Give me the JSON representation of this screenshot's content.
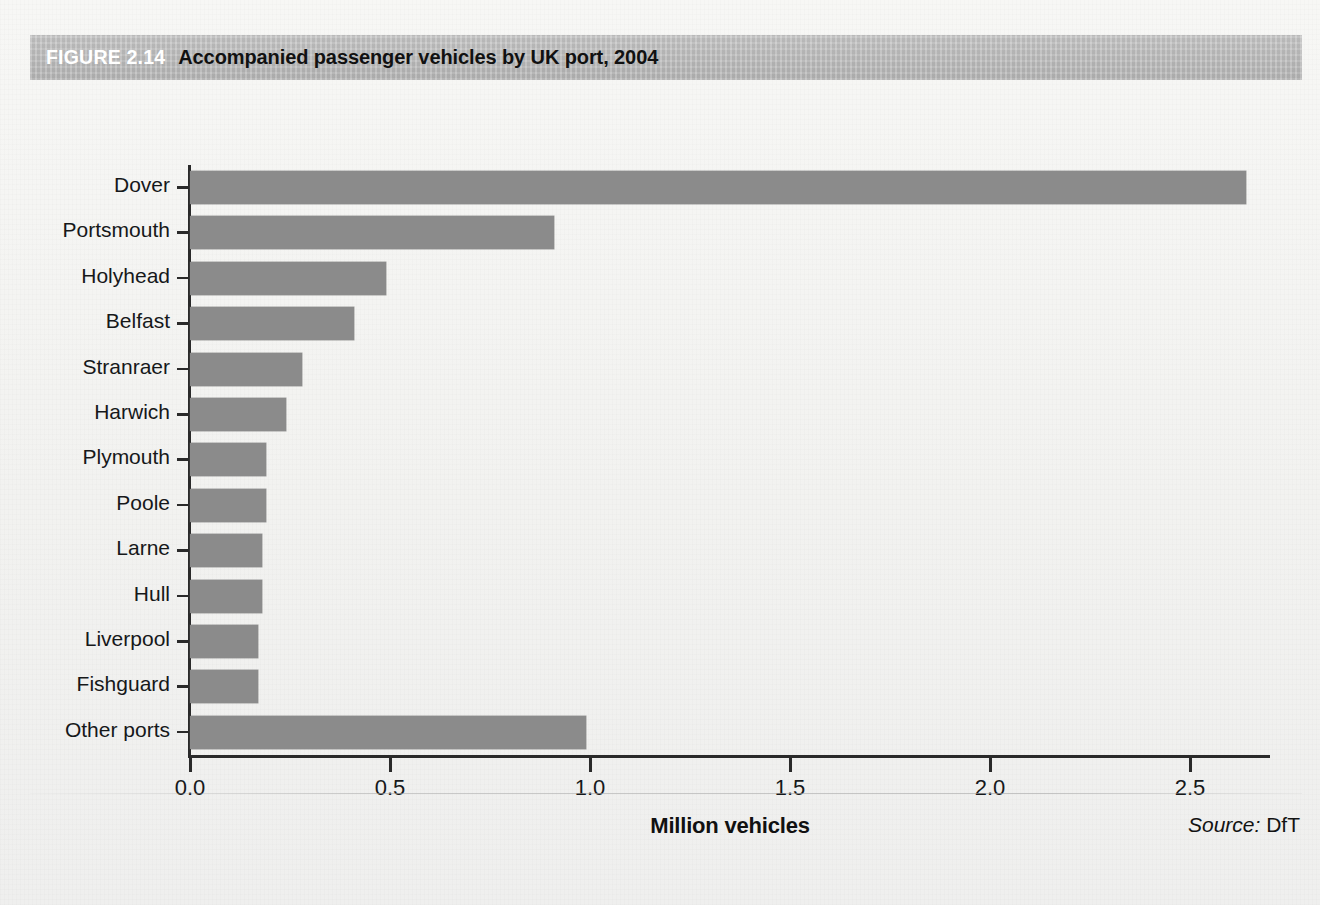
{
  "figure": {
    "number_label": "FIGURE 2.14",
    "title": "Accompanied passenger vehicles by UK port, 2004",
    "source_word": "Source:",
    "source_value": "DfT"
  },
  "chart_data": {
    "type": "bar",
    "orientation": "horizontal",
    "title": "Accompanied passenger vehicles by UK port, 2004",
    "subtitle": "",
    "xlabel": "Million vehicles",
    "ylabel": "",
    "xlim": [
      0.0,
      2.7
    ],
    "xticks": [
      "0.0",
      "0.5",
      "1.0",
      "1.5",
      "2.0",
      "2.5"
    ],
    "xtick_values": [
      0.0,
      0.5,
      1.0,
      1.5,
      2.0,
      2.5
    ],
    "grid": false,
    "legend": false,
    "legend_position": "none",
    "bar_color": "#8b8b8b",
    "axis_color": "#2a2a2a",
    "categories": [
      "Dover",
      "Portsmouth",
      "Holyhead",
      "Belfast",
      "Stranraer",
      "Harwich",
      "Plymouth",
      "Poole",
      "Larne",
      "Hull",
      "Liverpool",
      "Fishguard",
      "Other ports"
    ],
    "values": [
      2.64,
      0.91,
      0.49,
      0.41,
      0.28,
      0.24,
      0.19,
      0.19,
      0.18,
      0.18,
      0.17,
      0.17,
      0.99
    ],
    "units": "million vehicles",
    "bars": [
      {
        "label": "Dover",
        "value": 2.64
      },
      {
        "label": "Portsmouth",
        "value": 0.91
      },
      {
        "label": "Holyhead",
        "value": 0.49
      },
      {
        "label": "Belfast",
        "value": 0.41
      },
      {
        "label": "Stranraer",
        "value": 0.28
      },
      {
        "label": "Harwich",
        "value": 0.24
      },
      {
        "label": "Plymouth",
        "value": 0.19
      },
      {
        "label": "Poole",
        "value": 0.19
      },
      {
        "label": "Larne",
        "value": 0.18
      },
      {
        "label": "Hull",
        "value": 0.18
      },
      {
        "label": "Liverpool",
        "value": 0.17
      },
      {
        "label": "Fishguard",
        "value": 0.17
      },
      {
        "label": "Other ports",
        "value": 0.99
      }
    ]
  }
}
